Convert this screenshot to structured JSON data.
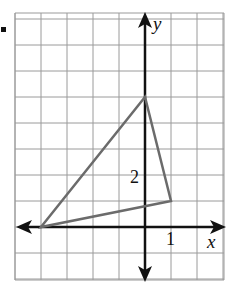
{
  "problem": {
    "bullet": "•",
    "axes": {
      "x_label": "x",
      "y_label": "y"
    },
    "tick_labels": {
      "x": "1",
      "y": "2"
    },
    "grid": {
      "x_min": -5,
      "x_max": 3,
      "y_min": -2,
      "y_max": 8,
      "unit_px": 26,
      "origin_px": [
        145,
        227
      ]
    },
    "triangle": {
      "vertices": [
        [
          -4,
          0
        ],
        [
          0,
          5
        ],
        [
          1,
          1
        ]
      ],
      "stroke": "#6b6b6b"
    },
    "colors": {
      "grid": "#9a9a9a",
      "axis": "#111111",
      "triangle": "#6b6b6b"
    }
  }
}
